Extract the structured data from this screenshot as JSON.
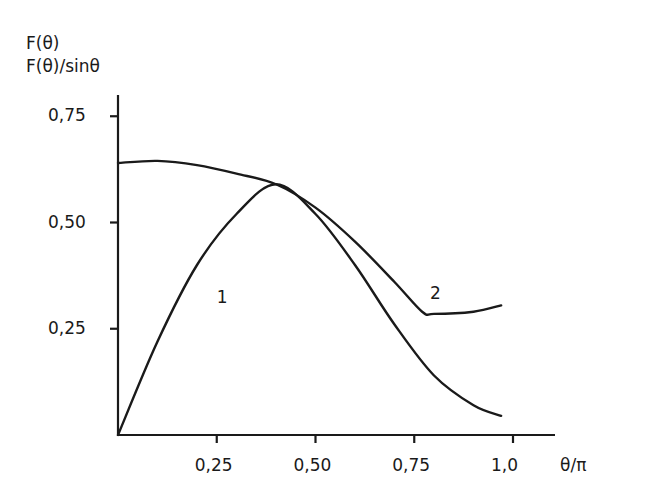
{
  "chart_data": {
    "type": "line",
    "title": "",
    "ylabel_lines": [
      "F(θ)",
      "F(θ)/sinθ"
    ],
    "xlabel": "θ/π",
    "x_ticks": [
      "0,25",
      "0,50",
      "0,75",
      "1,0"
    ],
    "x_tick_values": [
      0.25,
      0.5,
      0.75,
      1.0
    ],
    "y_ticks": [
      "0,25",
      "0,50",
      "0,75"
    ],
    "y_tick_values": [
      0.25,
      0.5,
      0.75
    ],
    "xlim": [
      0,
      1.05
    ],
    "ylim": [
      0,
      0.82
    ],
    "grid": false,
    "legend": "inline curve labels",
    "series": [
      {
        "name": "1",
        "label": "F(θ)",
        "x": [
          0,
          0.1,
          0.2,
          0.3,
          0.4,
          0.5,
          0.6,
          0.7,
          0.8,
          0.9,
          0.97
        ],
        "values": [
          0,
          0.22,
          0.4,
          0.52,
          0.59,
          0.52,
          0.4,
          0.26,
          0.14,
          0.07,
          0.045
        ]
      },
      {
        "name": "2",
        "label": "F(θ)/sinθ",
        "x": [
          0,
          0.1,
          0.2,
          0.3,
          0.4,
          0.5,
          0.6,
          0.7,
          0.77,
          0.8,
          0.9,
          0.97
        ],
        "values": [
          0.64,
          0.645,
          0.635,
          0.615,
          0.59,
          0.535,
          0.455,
          0.36,
          0.29,
          0.285,
          0.29,
          0.305
        ]
      }
    ],
    "annotations": [
      {
        "text": "1",
        "x": 0.25,
        "y": 0.32
      },
      {
        "text": "2",
        "x": 0.79,
        "y": 0.33
      }
    ]
  }
}
